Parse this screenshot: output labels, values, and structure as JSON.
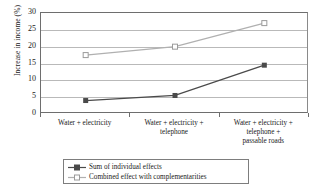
{
  "chart_data": {
    "type": "line",
    "title": "",
    "xlabel": "",
    "ylabel": "Increase in income (%)",
    "ylim": [
      0,
      30
    ],
    "yticks": [
      0,
      5,
      10,
      15,
      20,
      25,
      30
    ],
    "grid": true,
    "legend_position": "bottom",
    "categories": [
      "Water + electricity",
      "Water + electricity + telephone",
      "Water + electricity + telephone + passable roads"
    ],
    "category_lines": [
      [
        "Water + electricity"
      ],
      [
        "Water + electricity +",
        "telephone"
      ],
      [
        "Water + electricity +",
        "telephone +",
        "passable roads"
      ]
    ],
    "series": [
      {
        "name": "Sum of individual effects",
        "values": [
          4,
          5.5,
          14.5
        ],
        "color": "#4a4a4a",
        "marker": "filled-square"
      },
      {
        "name": "Combined effect with complementarities",
        "values": [
          17.5,
          20,
          27
        ],
        "color": "#b0b0b0",
        "marker": "open-square"
      }
    ]
  },
  "axis": {
    "y_title": "Increase in income (%)"
  },
  "colors": {
    "series_dark": "#4a4a4a",
    "series_light": "#b0b0b0",
    "grid": "#b9b9b9",
    "frame": "#6e6e6e",
    "background": "#ffffff"
  }
}
